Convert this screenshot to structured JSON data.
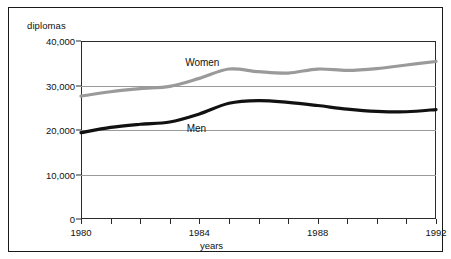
{
  "figure": {
    "y_axis_caption": "diplomas",
    "x_axis_caption": "years"
  },
  "chart_data": {
    "type": "line",
    "title": "",
    "xlabel": "years",
    "ylabel": "diplomas",
    "xlim": [
      1980,
      1992
    ],
    "ylim": [
      0,
      40000
    ],
    "ytick_labels": [
      "40,000",
      "30,000",
      "20,000",
      "10,000",
      "0"
    ],
    "ytick_values": [
      40000,
      30000,
      20000,
      10000,
      0
    ],
    "xtick_labels": [
      "1980",
      "1984",
      "1988",
      "1992"
    ],
    "xtick_values": [
      1980,
      1984,
      1988,
      1992
    ],
    "minor_xticks": [
      1981,
      1982,
      1983,
      1985,
      1986,
      1987,
      1989,
      1990,
      1991
    ],
    "grid": "horizontal",
    "legend_position": "inline-annotations",
    "x": [
      1980,
      1981,
      1982,
      1983,
      1984,
      1985,
      1986,
      1987,
      1988,
      1989,
      1990,
      1991,
      1992
    ],
    "series": [
      {
        "name": "Women",
        "color": "#9a9a9a",
        "label_x": 1984.1,
        "values": [
          27600,
          28600,
          29300,
          29800,
          31600,
          33700,
          33100,
          32800,
          33700,
          33400,
          33800,
          34600,
          35400
        ]
      },
      {
        "name": "Men",
        "color": "#111111",
        "label_x": 1983.9,
        "values": [
          19400,
          20600,
          21300,
          21800,
          23600,
          26000,
          26600,
          26200,
          25500,
          24700,
          24200,
          24100,
          24600
        ]
      }
    ]
  }
}
